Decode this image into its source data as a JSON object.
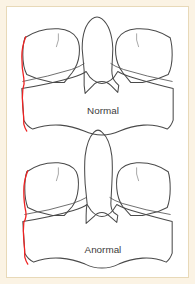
{
  "figure": {
    "name": "comparative-anatomy-line-drawing",
    "panel_background_color": "#fbf3e4",
    "inner_background_color": "#ffffff",
    "border_color": "#e8d9b8",
    "outline_color": "#4a4a4a",
    "highlight_color": "#ee2222",
    "diagrams": [
      {
        "id": "normal",
        "label": "Normal",
        "label_x": 97,
        "label_y": 110,
        "highlight_present": true,
        "highlight_side": "left"
      },
      {
        "id": "anormal",
        "label": "Anormal",
        "label_x": 97,
        "label_y": 250,
        "highlight_present": true,
        "highlight_side": "left"
      }
    ]
  }
}
